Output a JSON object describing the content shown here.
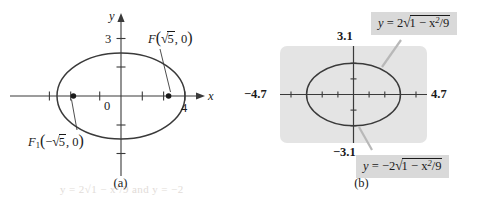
{
  "figure": {
    "kind": "two-panel-math-figure",
    "stroke_color": "#3a3a3a",
    "text_color": "#1a1a1a",
    "callout_bg": "#d9d9d9",
    "screen_bg": "#e4e4e4"
  },
  "panel_a": {
    "caption": "(a)",
    "x_axis_label": "x",
    "y_axis_label": "y",
    "origin_label": "0",
    "y_tick_label": "3",
    "x_tick_label": "4",
    "focus_right": {
      "name": "F",
      "subscript": "",
      "open_paren": "(",
      "radical": "√",
      "radicand": "5",
      "sign": "",
      "rest": ", 0",
      "close_paren": ")",
      "full_text": "F(√5, 0)"
    },
    "focus_left": {
      "name": "F",
      "subscript": "1",
      "open_paren": "(",
      "radical": "√",
      "radicand": "5",
      "sign": "−",
      "rest": ", 0",
      "close_paren": ")",
      "full_text": "F₁(−√5, 0)"
    },
    "curve": {
      "type": "ellipse",
      "equation": "x²/9 + y²/4 = 1",
      "semi_major_a": 3,
      "semi_minor_b": 2,
      "foci_x": [
        -2.236,
        2.236
      ],
      "center": [
        0,
        0
      ]
    }
  },
  "panel_b": {
    "caption": "(b)",
    "window": {
      "xmin_label": "−4.7",
      "xmax_label": "4.7",
      "ymax_label": "3.1",
      "ymin_label": "−3.1",
      "xmin": -4.7,
      "xmax": 4.7,
      "ymin": -3.1,
      "ymax": 3.1
    },
    "equation_top": {
      "lhs": "y",
      "eq": "=",
      "coef": "2",
      "radical": "√",
      "radicand_left": "1 − x",
      "exponent": "2",
      "radicand_right": "/9",
      "full_text": "y = 2√(1 − x²/9)"
    },
    "equation_bottom": {
      "lhs": "y",
      "eq": "=",
      "coef": "−2",
      "radical": "√",
      "radicand_left": "1 − x",
      "exponent": "2",
      "radicand_right": "/9",
      "full_text": "y = −2√(1 − x²/9)"
    },
    "curve": {
      "type": "ellipse",
      "equation": "x²/9 + y²/4 = 1",
      "semi_major_a": 3,
      "semi_minor_b": 2
    }
  },
  "bleed_text": "y = 2√1 − x²/9 and y = −2"
}
